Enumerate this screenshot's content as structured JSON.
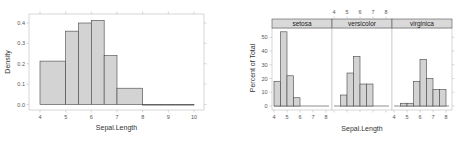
{
  "chart_data": [
    {
      "type": "bar",
      "title": "",
      "xlabel": "Sepal.Length",
      "ylabel": "Density",
      "xlim": [
        3.7,
        10.3
      ],
      "ylim": [
        -0.015,
        0.44
      ],
      "xticks": [
        4,
        5,
        6,
        7,
        8,
        9,
        10
      ],
      "xtick_labels": [
        "4",
        "5",
        "6",
        "7",
        "8",
        "9",
        "10"
      ],
      "yticks": [
        0.0,
        0.1,
        0.2,
        0.3,
        0.4
      ],
      "ytick_labels": [
        "0.0",
        "0.1",
        "0.2",
        "0.3",
        "0.4"
      ],
      "bins": [
        {
          "start": 4.0,
          "end": 5.0,
          "value": 0.213
        },
        {
          "start": 5.0,
          "end": 5.5,
          "value": 0.36
        },
        {
          "start": 5.5,
          "end": 6.0,
          "value": 0.4
        },
        {
          "start": 6.0,
          "end": 6.5,
          "value": 0.413
        },
        {
          "start": 6.5,
          "end": 7.0,
          "value": 0.24
        },
        {
          "start": 7.0,
          "end": 8.0,
          "value": 0.08
        },
        {
          "start": 8.0,
          "end": 10.0,
          "value": 0.0
        }
      ],
      "fill": "#d3d3d3",
      "stroke": "#444444",
      "grid": false
    },
    {
      "type": "bar",
      "title": "",
      "xlabel": "Sepal.Length",
      "ylabel": "Percent of Total",
      "xlim": [
        3.85,
        8.45
      ],
      "ylim": [
        -3,
        57
      ],
      "xticks": [
        4,
        5,
        6,
        7,
        8
      ],
      "xtick_labels": [
        "4",
        "5",
        "6",
        "7",
        "8"
      ],
      "yticks": [
        0,
        10,
        20,
        30,
        40,
        50
      ],
      "ytick_labels": [
        "0",
        "10",
        "20",
        "30",
        "40",
        "50"
      ],
      "panels": [
        {
          "name": "setosa",
          "bins": [
            {
              "start": 4.0,
              "end": 4.5,
              "value": 18
            },
            {
              "start": 4.5,
              "end": 5.0,
              "value": 54
            },
            {
              "start": 5.0,
              "end": 5.5,
              "value": 22
            },
            {
              "start": 5.5,
              "end": 6.0,
              "value": 6
            }
          ]
        },
        {
          "name": "versicolor",
          "bins": [
            {
              "start": 4.5,
              "end": 5.0,
              "value": 8
            },
            {
              "start": 5.0,
              "end": 5.5,
              "value": 24
            },
            {
              "start": 5.5,
              "end": 6.0,
              "value": 36
            },
            {
              "start": 6.0,
              "end": 6.5,
              "value": 16
            },
            {
              "start": 6.5,
              "end": 7.0,
              "value": 16
            }
          ]
        },
        {
          "name": "virginica",
          "bins": [
            {
              "start": 4.5,
              "end": 5.0,
              "value": 2
            },
            {
              "start": 5.0,
              "end": 5.5,
              "value": 2
            },
            {
              "start": 5.5,
              "end": 6.0,
              "value": 18
            },
            {
              "start": 6.0,
              "end": 6.5,
              "value": 34
            },
            {
              "start": 6.5,
              "end": 7.0,
              "value": 20
            },
            {
              "start": 7.0,
              "end": 7.5,
              "value": 12
            },
            {
              "start": 7.5,
              "end": 8.0,
              "value": 12
            }
          ]
        }
      ],
      "strip_fill": "#d9d9d9",
      "fill": "#d3d3d3",
      "stroke": "#444444",
      "grid": false
    }
  ]
}
